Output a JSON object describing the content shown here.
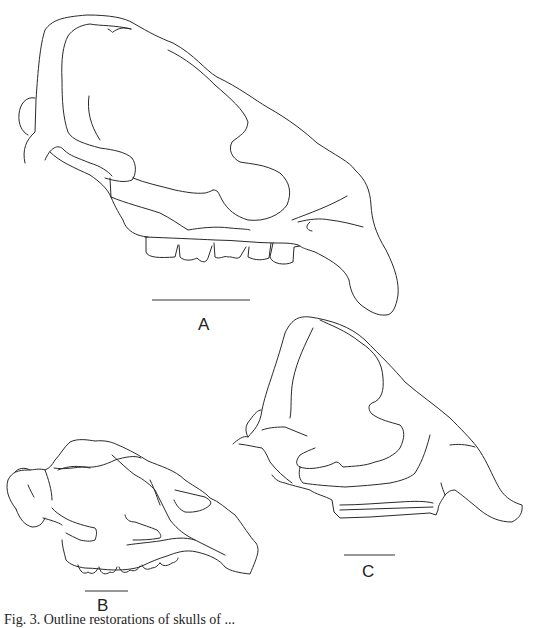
{
  "figure": {
    "type": "line drawing",
    "panels": [
      {
        "id": "A",
        "label": "A",
        "scale_bar": {
          "x1": 152,
          "x2": 250,
          "y": 300
        },
        "label_pos": {
          "x": 198,
          "y": 316
        }
      },
      {
        "id": "B",
        "label": "B",
        "scale_bar": {
          "x1": 85,
          "x2": 128,
          "y": 591
        },
        "label_pos": {
          "x": 97,
          "y": 597
        }
      },
      {
        "id": "C",
        "label": "C",
        "scale_bar": {
          "x1": 344,
          "x2": 395,
          "y": 555
        },
        "label_pos": {
          "x": 362,
          "y": 563
        }
      }
    ],
    "caption": "Fig. 3.  Outline restorations of skulls of ..."
  }
}
